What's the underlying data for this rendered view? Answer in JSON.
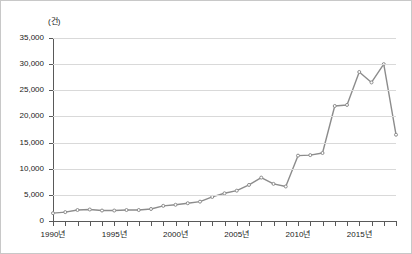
{
  "chart_data": {
    "type": "line",
    "title": "",
    "xlabel": "",
    "ylabel": "",
    "unit_label": "(건)",
    "grid": true,
    "legend": false,
    "line_color": "#8c8c8c",
    "marker_color": "#8c8c8c",
    "axis_color": "#595959",
    "gridline_color": "#d9d9d9",
    "ylim": [
      0,
      35000
    ],
    "ytick_values": [
      0,
      5000,
      10000,
      15000,
      20000,
      25000,
      30000,
      35000
    ],
    "ytick_labels": [
      "0",
      "5,000",
      "10,000",
      "15,000",
      "20,000",
      "25,000",
      "30,000",
      "35,000"
    ],
    "xlim": [
      1990,
      2018
    ],
    "xtick_years": [
      1990,
      1991,
      1992,
      1993,
      1994,
      1995,
      1996,
      1997,
      1998,
      1999,
      2000,
      2001,
      2002,
      2003,
      2004,
      2005,
      2006,
      2007,
      2008,
      2009,
      2010,
      2011,
      2012,
      2013,
      2014,
      2015,
      2016,
      2017,
      2018
    ],
    "xtick_labeled": [
      {
        "year": 1990,
        "label": "1990년"
      },
      {
        "year": 1995,
        "label": "1995년"
      },
      {
        "year": 2000,
        "label": "2000년"
      },
      {
        "year": 2005,
        "label": "2005년"
      },
      {
        "year": 2010,
        "label": "2010년"
      },
      {
        "year": 2015,
        "label": "2015년"
      }
    ],
    "x": [
      1990,
      1991,
      1992,
      1993,
      1994,
      1995,
      1996,
      1997,
      1998,
      1999,
      2000,
      2001,
      2002,
      2003,
      2004,
      2005,
      2006,
      2007,
      2008,
      2009,
      2010,
      2011,
      2012,
      2013,
      2014,
      2015,
      2016,
      2017,
      2018
    ],
    "values": [
      1500,
      1700,
      2100,
      2200,
      2000,
      2000,
      2100,
      2100,
      2300,
      2900,
      3100,
      3400,
      3700,
      4600,
      5300,
      5800,
      6900,
      8300,
      7100,
      6600,
      12500,
      12600,
      13000,
      22000,
      22200,
      28500,
      26500,
      30000,
      16500
    ],
    "series": [
      {
        "name": "건수",
        "values": [
          1500,
          1700,
          2100,
          2200,
          2000,
          2000,
          2100,
          2100,
          2300,
          2900,
          3100,
          3400,
          3700,
          4600,
          5300,
          5800,
          6900,
          8300,
          7100,
          6600,
          12500,
          12600,
          13000,
          22000,
          22200,
          28500,
          26500,
          30000,
          16500
        ]
      }
    ]
  }
}
